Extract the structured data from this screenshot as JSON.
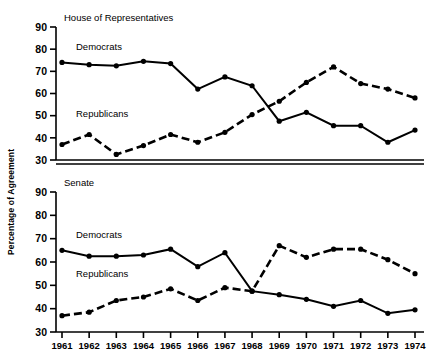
{
  "figure": {
    "ylabel": "Percentage of Agreement",
    "x_categories": [
      "1961",
      "1962",
      "1963",
      "1964",
      "1965",
      "1966",
      "1967",
      "1968",
      "1969",
      "1970",
      "1971",
      "1972",
      "1973",
      "1974"
    ],
    "y_ticks": [
      "90",
      "80",
      "70",
      "60",
      "50",
      "40",
      "30"
    ]
  },
  "panels": [
    {
      "title": "House of Representatives",
      "democrats_label": "Democrats",
      "republicans_label": "Republicans"
    },
    {
      "title": "Senate",
      "democrats_label": "Democrats",
      "republicans_label": "Republicans"
    }
  ],
  "chart_data": [
    {
      "type": "line",
      "title": "House of Representatives",
      "xlabel": "",
      "ylabel": "Percentage of Agreement",
      "x": [
        "1961",
        "1962",
        "1963",
        "1964",
        "1965",
        "1966",
        "1967",
        "1968",
        "1969",
        "1970",
        "1971",
        "1972",
        "1973",
        "1974"
      ],
      "ylim": [
        30,
        90
      ],
      "xlim": [
        "1961",
        "1974"
      ],
      "grid": false,
      "legend": "inline-labels",
      "series": [
        {
          "name": "Democrats",
          "style": "solid",
          "marker": "filled-circle",
          "values": [
            74,
            73,
            72.5,
            74.5,
            73.5,
            62,
            67.5,
            63.5,
            47.5,
            51.5,
            45.5,
            45.5,
            38,
            43.5
          ]
        },
        {
          "name": "Republicans",
          "style": "dashed",
          "marker": "filled-circle",
          "values": [
            37,
            41.5,
            32.5,
            36.5,
            41.5,
            38,
            42.5,
            50.5,
            56.5,
            65,
            72,
            64.5,
            62,
            58
          ]
        }
      ]
    },
    {
      "type": "line",
      "title": "Senate",
      "xlabel": "",
      "ylabel": "Percentage of Agreement",
      "x": [
        "1961",
        "1962",
        "1963",
        "1964",
        "1965",
        "1966",
        "1967",
        "1968",
        "1969",
        "1970",
        "1971",
        "1972",
        "1973",
        "1974"
      ],
      "ylim": [
        30,
        90
      ],
      "xlim": [
        "1961",
        "1974"
      ],
      "grid": false,
      "legend": "inline-labels",
      "series": [
        {
          "name": "Democrats",
          "style": "solid",
          "marker": "filled-circle",
          "values": [
            65,
            62.5,
            62.5,
            63,
            65.5,
            58,
            64,
            47.5,
            46,
            44,
            41,
            43.5,
            38,
            39.5
          ]
        },
        {
          "name": "Republicans",
          "style": "dashed",
          "marker": "filled-circle",
          "values": [
            37,
            38.5,
            43.5,
            45,
            48.5,
            43.5,
            49,
            47.5,
            67,
            62,
            65.5,
            65.5,
            61,
            55
          ]
        }
      ]
    }
  ]
}
